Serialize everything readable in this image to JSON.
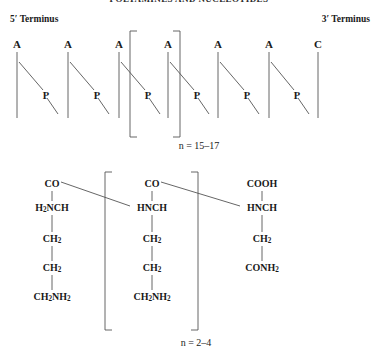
{
  "running_head": "POLYAMINES AND NUCLEOTIDES",
  "labels": {
    "terminus_5": "5′ Terminus",
    "terminus_3": "3′ Terminus",
    "n_nucleotide": "n = 15–17",
    "n_polyamine": "n = 2–4"
  },
  "nucleotide_chain": {
    "bases": [
      {
        "label": "A",
        "x": 17
      },
      {
        "label": "A",
        "x": 68
      },
      {
        "label": "A",
        "x": 119
      },
      {
        "label": "A",
        "x": 168
      },
      {
        "label": "A",
        "x": 218
      },
      {
        "label": "A",
        "x": 269
      },
      {
        "label": "C",
        "x": 318
      }
    ],
    "phosphates": [
      {
        "label": "P",
        "x": 46
      },
      {
        "label": "P",
        "x": 97
      },
      {
        "label": "P",
        "x": 148
      },
      {
        "label": "P",
        "x": 197
      },
      {
        "label": "P",
        "x": 247
      },
      {
        "label": "P",
        "x": 297
      }
    ],
    "bracket_left_x": 130,
    "bracket_right_x": 180,
    "bracket_top_y": 31,
    "bracket_bottom_y": 137
  },
  "polyamine": {
    "columns": [
      {
        "id": "left-residue",
        "x": 52,
        "nodes": [
          {
            "text": "CO",
            "y": 178,
            "html": "CO"
          },
          {
            "text": "H2NCH",
            "y": 202,
            "html": "H<sub>2</sub>NCH"
          },
          {
            "text": "CH2",
            "y": 233,
            "html": "CH<sub>2</sub>"
          },
          {
            "text": "CH2",
            "y": 262,
            "html": "CH<sub>2</sub>"
          },
          {
            "text": "CH2NH2",
            "y": 291,
            "html": "CH<sub>2</sub>NH<sub>2</sub>"
          }
        ]
      },
      {
        "id": "middle-residue",
        "x": 152,
        "nodes": [
          {
            "text": "CO",
            "y": 178,
            "html": "CO"
          },
          {
            "text": "HNCH",
            "y": 202,
            "html": "HNCH"
          },
          {
            "text": "CH2",
            "y": 233,
            "html": "CH<sub>2</sub>"
          },
          {
            "text": "CH2",
            "y": 262,
            "html": "CH<sub>2</sub>"
          },
          {
            "text": "CH2NH2",
            "y": 291,
            "html": "CH<sub>2</sub>NH<sub>2</sub>"
          }
        ]
      },
      {
        "id": "right-residue",
        "x": 262,
        "nodes": [
          {
            "text": "COOH",
            "y": 178,
            "html": "COOH"
          },
          {
            "text": "HNCH",
            "y": 202,
            "html": "HNCH"
          },
          {
            "text": "CH2",
            "y": 233,
            "html": "CH<sub>2</sub>"
          },
          {
            "text": "CONH2",
            "y": 262,
            "html": "CONH<sub>2</sub>"
          }
        ]
      }
    ],
    "bracket_left_x": 105,
    "bracket_right_x": 198,
    "bracket_top_y": 172,
    "bracket_bottom_y": 330
  },
  "colors": {
    "ink": "#1a1a1a",
    "rule": "#555555",
    "background": "#ffffff"
  }
}
